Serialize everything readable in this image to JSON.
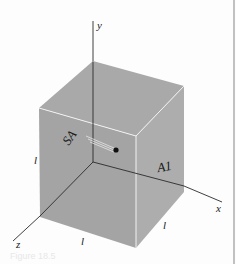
{
  "figure": {
    "axes": {
      "x_label": "x",
      "y_label": "y",
      "z_label": "z"
    },
    "edges": {
      "left_vertical_label": "l",
      "bottom_front_label": "l",
      "bottom_right_label": "l"
    },
    "faces": {
      "left_face_label": "SA",
      "right_face_label": "A1"
    },
    "colors": {
      "cube_top": "#a9a9a9",
      "cube_front": "#a3a3a3",
      "cube_right": "#b0b0b0",
      "edge_highlight": "#f2f2f2",
      "axis": "#2a2a2a",
      "particle": "#111111",
      "border": "#9a9a9a"
    },
    "caption": "Figure 18.5"
  }
}
